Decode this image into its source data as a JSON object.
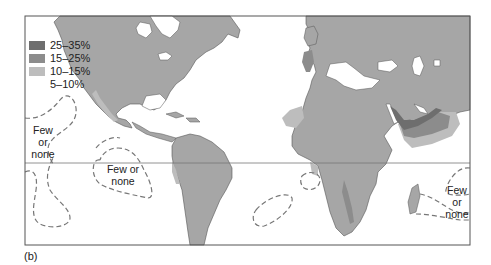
{
  "figure": {
    "panel_label": "(b)",
    "colors": {
      "land": "#a6a6a6",
      "ocean": "#ffffff",
      "inland_water": "#ffffff",
      "frame": "#555555",
      "equator": "#777777",
      "level_25_35": "#6e6e6e",
      "level_15_25": "#8c8c8c",
      "level_10_15": "#bdbdbd",
      "level_5_10": "#ffffff"
    }
  },
  "legend": {
    "items": [
      {
        "label": "25–35%",
        "color": "#6e6e6e"
      },
      {
        "label": "15–25%",
        "color": "#8c8c8c"
      },
      {
        "label": "10–15%",
        "color": "#bdbdbd"
      },
      {
        "label": "5–10%",
        "color": "none"
      }
    ]
  },
  "annotations": {
    "few_or_none_west": {
      "line1": "Few",
      "line2": "or",
      "line3": "none"
    },
    "few_or_none_pacific": {
      "line1": "Few or",
      "line2": "none"
    },
    "few_or_none_east": {
      "line1": "Few",
      "line2": "or",
      "line3": "none"
    }
  }
}
